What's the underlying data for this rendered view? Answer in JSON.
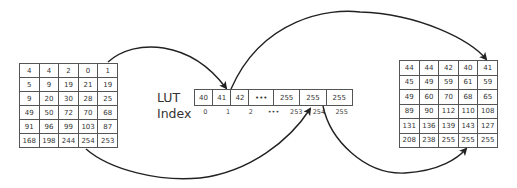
{
  "diagram": {
    "type": "lookup-table-mapping",
    "input_image": {
      "rows": [
        [
          "4",
          "4",
          "2",
          "0",
          "1"
        ],
        [
          "5",
          "9",
          "19",
          "21",
          "19"
        ],
        [
          "9",
          "20",
          "30",
          "28",
          "25"
        ],
        [
          "49",
          "50",
          "72",
          "70",
          "68"
        ],
        [
          "91",
          "96",
          "99",
          "103",
          "87"
        ],
        [
          "168",
          "198",
          "244",
          "254",
          "253"
        ]
      ]
    },
    "lut": {
      "label": "LUT",
      "values": [
        "40",
        "41",
        "42",
        "•••",
        "255",
        "255",
        "255"
      ]
    },
    "index": {
      "label": "Index",
      "values": [
        "0",
        "1",
        "2",
        "•••",
        "253",
        "254",
        "255"
      ]
    },
    "output_image": {
      "rows": [
        [
          "44",
          "44",
          "42",
          "40",
          "41"
        ],
        [
          "45",
          "49",
          "59",
          "61",
          "59"
        ],
        [
          "49",
          "60",
          "70",
          "68",
          "65"
        ],
        [
          "89",
          "90",
          "112",
          "110",
          "108"
        ],
        [
          "131",
          "136",
          "139",
          "143",
          "127"
        ],
        [
          "208",
          "238",
          "255",
          "255",
          "255"
        ]
      ]
    },
    "arrows": [
      {
        "from": "input[0][4] (value 1)",
        "to": "LUT index 1 (value 41)"
      },
      {
        "from": "LUT index 1 (value 41)",
        "to": "output[0][4] (value 41)"
      },
      {
        "from": "input[5][3] (value 254)",
        "to": "LUT index 254"
      },
      {
        "from": "LUT index 254 (value 255)",
        "to": "output[5][3] (value 255)"
      }
    ],
    "colors": {
      "line": "#2a2a2a",
      "background": "#ffffff"
    }
  }
}
